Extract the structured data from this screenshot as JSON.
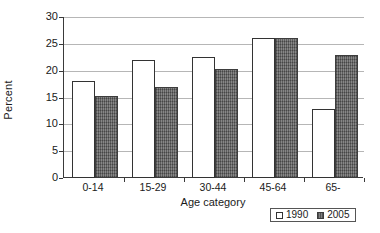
{
  "chart_data": {
    "type": "bar",
    "title": "",
    "xlabel": "Age category",
    "ylabel": "Percent",
    "categories": [
      "0-14",
      "15-29",
      "30-44",
      "45-64",
      "65-"
    ],
    "series": [
      {
        "name": "1990",
        "values": [
          18,
          22,
          22.5,
          26,
          12.8
        ],
        "color": "#ffffff"
      },
      {
        "name": "2005",
        "values": [
          15.3,
          17,
          20.3,
          26,
          23
        ],
        "color": "#6e6e6e"
      }
    ],
    "ylim": [
      0,
      30
    ],
    "yticks": [
      0,
      5,
      10,
      15,
      20,
      25,
      30
    ],
    "ytick_labels": [
      "0",
      "5",
      "10",
      "15",
      "20",
      "25",
      "30"
    ],
    "grid": true,
    "legend_position": "bottom-right"
  },
  "legend": {
    "entries": [
      {
        "label": "1990",
        "swatch": "hollow-square-icon"
      },
      {
        "label": "2005",
        "swatch": "hatched-square-icon"
      }
    ]
  },
  "caption": ""
}
